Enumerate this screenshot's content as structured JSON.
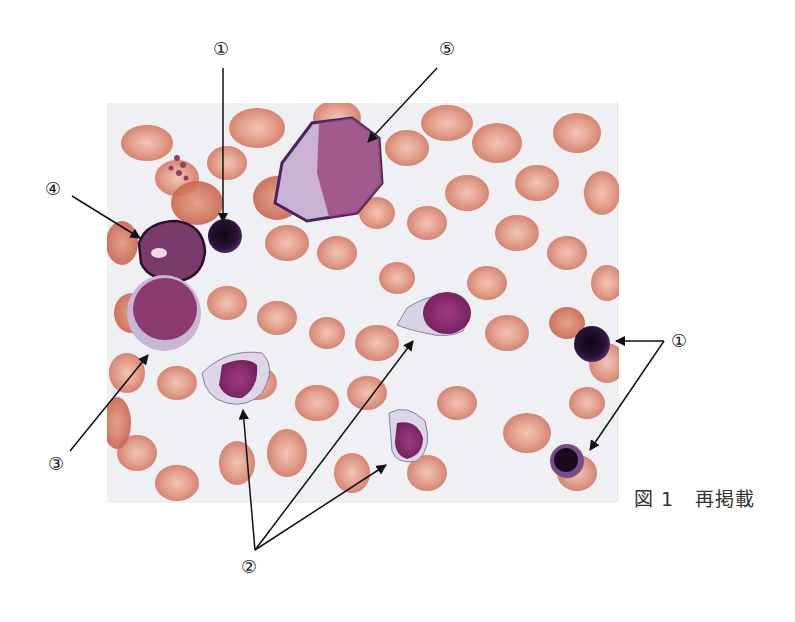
{
  "figure": {
    "caption": {
      "figure_label": "図 1",
      "note": "再掲載"
    },
    "labels": [
      {
        "id": "label-1-top",
        "text": "①"
      },
      {
        "id": "label-5",
        "text": "⑤"
      },
      {
        "id": "label-4",
        "text": "④"
      },
      {
        "id": "label-3",
        "text": "③"
      },
      {
        "id": "label-1-right",
        "text": "①"
      },
      {
        "id": "label-2",
        "text": "②"
      }
    ],
    "colors": {
      "background": "#eef0f4",
      "rbc": "#d9806a",
      "rbc_light": "#e7a896",
      "nucleus_dark": "#2a1238",
      "nucleus_purple": "#8a2a6e",
      "cytoplasm_pale": "#d8cfe2",
      "arrow": "#111111"
    }
  }
}
